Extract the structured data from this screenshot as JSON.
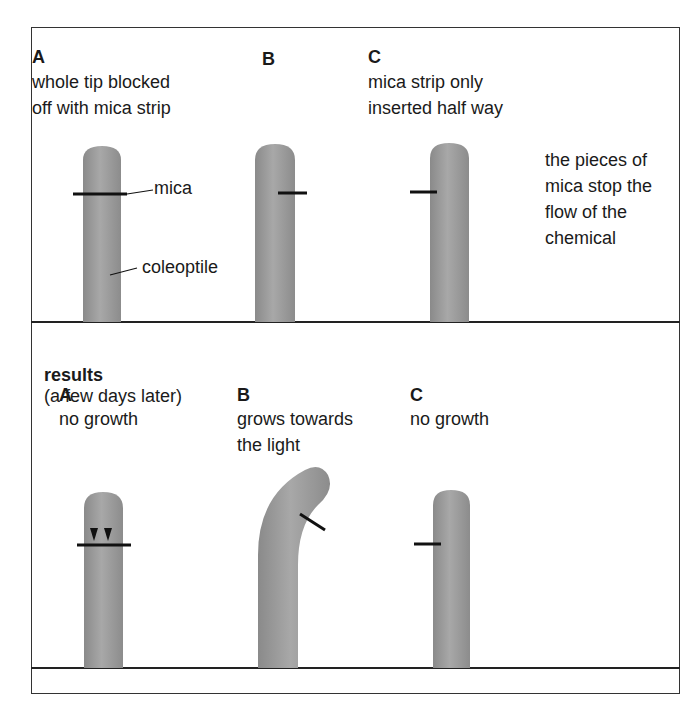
{
  "setup": {
    "A": {
      "letter": "A",
      "line1": "whole tip blocked",
      "line2": "off with mica strip"
    },
    "B": {
      "letter": "B"
    },
    "C": {
      "letter": "C",
      "line1": "mica strip only",
      "line2": "inserted half way"
    },
    "note": {
      "line1": "the pieces of",
      "line2": "mica stop the",
      "line3": "flow of the",
      "line4": "chemical"
    },
    "labels": {
      "mica": "mica",
      "coleoptile": "coleoptile"
    }
  },
  "results": {
    "heading_bold": "results",
    "heading_rest": "(a few days later)",
    "A": {
      "letter": "A",
      "line1": "no growth"
    },
    "B": {
      "letter": "B",
      "line1": "grows towards",
      "line2": "the light"
    },
    "C": {
      "letter": "C",
      "line1": "no growth"
    }
  },
  "colors": {
    "coleoptile": "#9a9a9a",
    "mica": "#111111",
    "border": "#333333"
  }
}
